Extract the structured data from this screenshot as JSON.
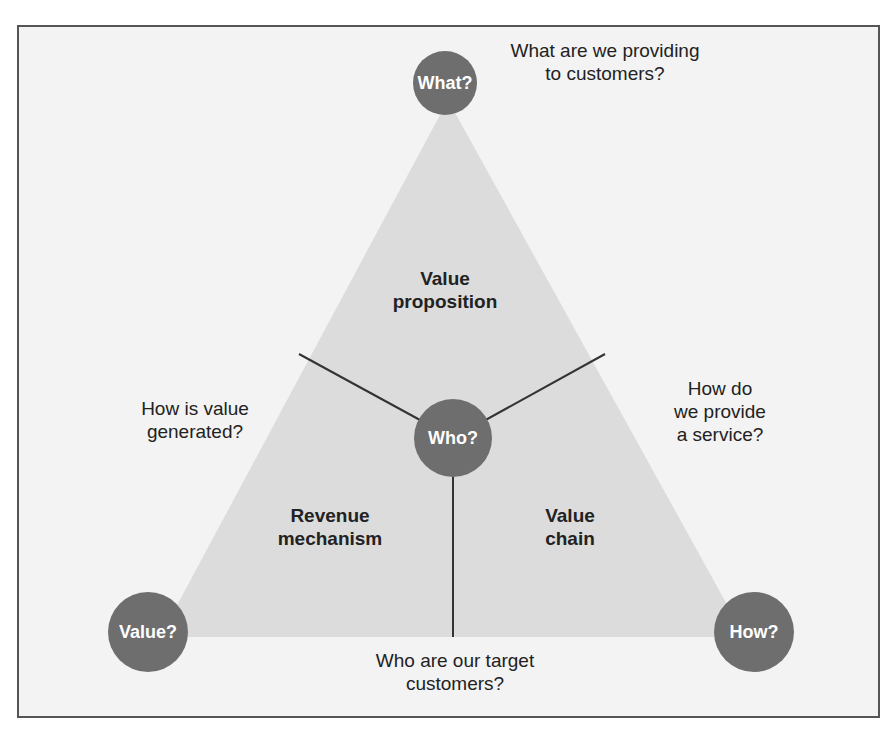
{
  "diagram": {
    "type": "business-model-triangle",
    "colors": {
      "frame_bg": "#f3f3f3",
      "triangle_fill": "#dcdcdc",
      "node_fill": "#6e6e6e",
      "node_text": "#ffffff",
      "line": "#333333"
    },
    "nodes": {
      "what": "What?",
      "who": "Who?",
      "value": "Value?",
      "how": "How?"
    },
    "segments": {
      "value_proposition": [
        "Value",
        "proposition"
      ],
      "revenue_mechanism": [
        "Revenue",
        "mechanism"
      ],
      "value_chain": [
        "Value",
        "chain"
      ]
    },
    "questions": {
      "what": [
        "What are we providing",
        "to customers?"
      ],
      "value": [
        "How is value",
        "generated?"
      ],
      "how": [
        "How do",
        "we provide",
        "a service?"
      ],
      "who": [
        "Who are our target",
        "customers?"
      ]
    }
  }
}
